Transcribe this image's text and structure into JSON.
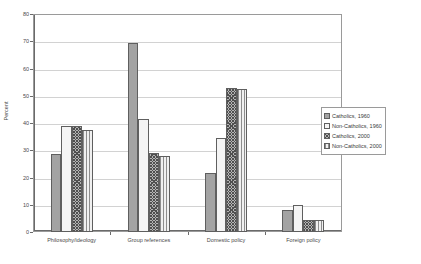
{
  "chart_data": {
    "type": "bar",
    "title": "",
    "subtitle": "",
    "xlabel": "",
    "ylabel": "Percent",
    "ylim": [
      0,
      80
    ],
    "ytick_step": 10,
    "yticks": [
      "0",
      "10",
      "20",
      "30",
      "40",
      "50",
      "60",
      "70",
      "80"
    ],
    "grid": true,
    "legend_position": "right",
    "categories": [
      "Philosophy/ideology",
      "Group references",
      "Domestic policy",
      "Foreign policy"
    ],
    "series": [
      {
        "name": "Catholics, 1960",
        "pattern": "solid-gray",
        "values": [
          28.5,
          69.5,
          21.5,
          8.0
        ]
      },
      {
        "name": "Non-Catholics, 1960",
        "pattern": "light-dotted",
        "values": [
          39.0,
          41.5,
          34.5,
          10.0
        ]
      },
      {
        "name": "Catholics, 2000",
        "pattern": "dark-crosshatch",
        "values": [
          39.0,
          29.0,
          53.0,
          4.5
        ]
      },
      {
        "name": "Non-Catholics, 2000",
        "pattern": "vertical-stripes",
        "values": [
          37.5,
          28.0,
          52.5,
          4.5
        ]
      }
    ]
  },
  "colors": {
    "series_1": "#a3a3a3",
    "series_2": "#f4f4f4",
    "series_3": "#b4b4b4",
    "series_4": "#f0f0f0",
    "bar_border": "#5f5f5f",
    "gridline": "#d2d2d2",
    "axis": "#6a6a6a",
    "text": "#3a3a3a",
    "background": "#ffffff"
  }
}
